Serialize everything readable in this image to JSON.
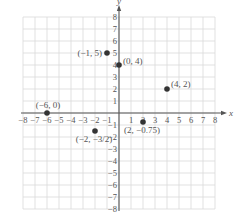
{
  "chart_data": {
    "type": "scatter",
    "title": "",
    "xlabel": "x",
    "ylabel": "y",
    "xlim": [
      -8,
      8
    ],
    "ylim": [
      -8,
      8
    ],
    "grid": true,
    "x_ticks": [
      -8,
      -7,
      -6,
      -5,
      -4,
      -3,
      -2,
      -1,
      1,
      2,
      3,
      4,
      5,
      6,
      7,
      8
    ],
    "y_ticks": [
      -8,
      -7,
      -6,
      -5,
      -4,
      -3,
      -2,
      -1,
      1,
      2,
      3,
      4,
      5,
      6,
      7,
      8
    ],
    "x_tick_labels": [
      "−8",
      "−7",
      "−6",
      "−5",
      "−4",
      "−3",
      "−2",
      "−1",
      "1",
      "2",
      "3",
      "4",
      "5",
      "6",
      "7",
      "8"
    ],
    "y_tick_labels": [
      "−8",
      "−7",
      "−6",
      "−5",
      "−4",
      "−3",
      "−2",
      "−1",
      "1",
      "2",
      "3",
      "4",
      "5",
      "6",
      "7",
      "8"
    ],
    "points": [
      {
        "x": -1,
        "y": 5,
        "label": "(−1, 5)",
        "label_pos": "left"
      },
      {
        "x": 0,
        "y": 4,
        "label": "(0, 4)",
        "label_pos": "right"
      },
      {
        "x": 4,
        "y": 2,
        "label": "(4, 2)",
        "label_pos": "upper-right"
      },
      {
        "x": -6,
        "y": 0,
        "label": "(−6, 0)",
        "label_pos": "above"
      },
      {
        "x": -2,
        "y": -1.5,
        "label": "(−2, −3/2)",
        "label_pos": "below"
      },
      {
        "x": 2,
        "y": -0.75,
        "label": "(2, −0.75)",
        "label_pos": "below"
      }
    ]
  }
}
